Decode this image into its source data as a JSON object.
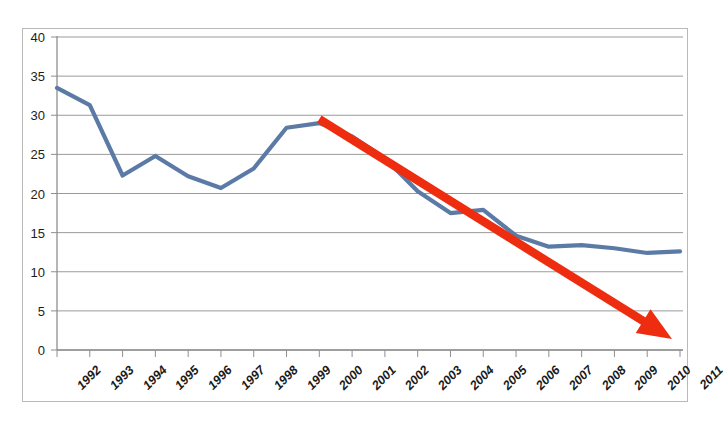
{
  "figure": {
    "clipped_caption_above": "",
    "background_color": "#ffffff",
    "frame_border_color": "#b9b9b9"
  },
  "axes": {
    "y_ticks": [
      "40",
      "35",
      "30",
      "25",
      "20",
      "15",
      "10",
      "5",
      "0"
    ],
    "x_ticks": [
      "1992",
      "1993",
      "1994",
      "1995",
      "1996",
      "1997",
      "1998",
      "1999",
      "2000",
      "2001",
      "2002",
      "2003",
      "2004",
      "2005",
      "2006",
      "2007",
      "2008",
      "2009",
      "2010",
      "2011"
    ]
  },
  "colors": {
    "series_line": "#5b7ba6",
    "trend_arrow": "#ee2d10",
    "gridline": "#9a9a9a",
    "axis_line": "#8f8f8f",
    "tick_text": "#1a1a1a"
  },
  "chart_data": {
    "type": "line",
    "title": "",
    "subtitle": "",
    "xlabel": "",
    "ylabel": "",
    "x": [
      "1992",
      "1993",
      "1994",
      "1995",
      "1996",
      "1997",
      "1998",
      "1999",
      "2000",
      "2001",
      "2002",
      "2003",
      "2004",
      "2005",
      "2006",
      "2007",
      "2008",
      "2009",
      "2010",
      "2011"
    ],
    "series": [
      {
        "name": "",
        "color": "#5b7ba6",
        "values": [
          33.5,
          31.3,
          22.3,
          24.8,
          22.2,
          20.7,
          23.2,
          28.4,
          29.0,
          27.3,
          24.5,
          20.3,
          17.5,
          17.9,
          14.6,
          13.2,
          13.4,
          13.0,
          12.4,
          12.6
        ]
      }
    ],
    "annotations": [
      {
        "type": "arrow",
        "name": "downward-trend-arrow",
        "color": "#ee2d10",
        "from": {
          "x": "2000",
          "y": 29.5
        },
        "to": {
          "x": "2011",
          "y": 1.4
        }
      }
    ],
    "ylim": [
      0,
      40
    ],
    "ytick_step": 5,
    "grid": true,
    "grid_axis": "y",
    "legend": false,
    "legend_position": "none",
    "markers": false
  }
}
